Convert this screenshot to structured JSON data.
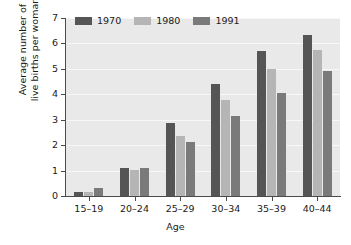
{
  "chart_data": {
    "type": "bar",
    "title": "",
    "subtitle": "",
    "xlabel": "Age",
    "ylabel": "Average number of live births per woman",
    "ylabel_lines": [
      "Average number of",
      "live births per woman"
    ],
    "categories": [
      "15–19",
      "20–24",
      "25–29",
      "30–34",
      "35–39",
      "40–44"
    ],
    "series": [
      {
        "name": "1970",
        "color": "#555555",
        "values": [
          0.15,
          1.12,
          2.88,
          4.4,
          5.7,
          6.35
        ]
      },
      {
        "name": "1980",
        "color": "#b5b5b5",
        "values": [
          0.17,
          1.02,
          2.35,
          3.78,
          5.0,
          5.75
        ]
      },
      {
        "name": "1991",
        "color": "#7a7a7a",
        "values": [
          0.3,
          1.12,
          2.14,
          3.15,
          4.05,
          4.9
        ]
      }
    ],
    "ylim": [
      0,
      7
    ],
    "ytick_labels": [
      "0",
      "1",
      "2",
      "3",
      "4",
      "5",
      "6",
      "7"
    ],
    "ytick_values": [
      0,
      1,
      2,
      3,
      4,
      5,
      6,
      7
    ],
    "grid": true,
    "grid_axis": "y",
    "legend_position": "top-left-inside",
    "plot_background": "#e9e9e9",
    "axis_color": "#4a4a4a",
    "gridline_color": "#f7f7f7",
    "text_color": "#1a1a1a"
  }
}
